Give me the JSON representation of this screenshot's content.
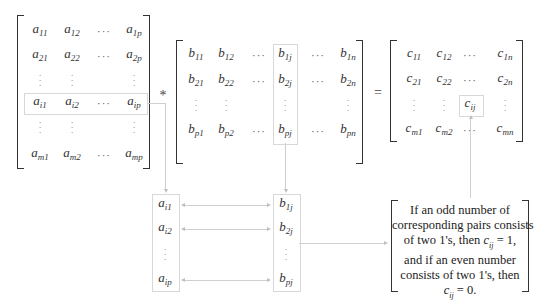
{
  "matrix_a": {
    "name": "A",
    "rows": [
      [
        "a_11",
        "a_12",
        "⋯",
        "a_1p"
      ],
      [
        "a_21",
        "a_22",
        "⋯",
        "a_2p"
      ],
      [
        "⋮",
        "⋮",
        "",
        "⋮"
      ],
      [
        "a_i1",
        "a_i2",
        "⋯",
        "a_ip"
      ],
      [
        "⋮",
        "⋮",
        "",
        "⋮"
      ],
      [
        "a_m1",
        "a_m2",
        "⋯",
        "a_mp"
      ]
    ],
    "highlighted_row": "i"
  },
  "operator_multiply": "*",
  "matrix_b": {
    "name": "B",
    "rows": [
      [
        "b_11",
        "b_12",
        "⋯",
        "b_1j",
        "⋯",
        "b_1n"
      ],
      [
        "b_21",
        "b_22",
        "⋯",
        "b_2j",
        "⋯",
        "b_2n"
      ],
      [
        "⋮",
        "⋮",
        "",
        "⋮",
        "",
        "⋮"
      ],
      [
        "b_p1",
        "b_p2",
        "⋯",
        "b_pj",
        "⋯",
        "b_pn"
      ]
    ],
    "highlighted_column": "j"
  },
  "operator_equals": "=",
  "matrix_c": {
    "name": "C",
    "rows": [
      [
        "c_11",
        "c_12",
        "⋯",
        "c_1n"
      ],
      [
        "c_21",
        "c_22",
        "⋯",
        "c_2n"
      ],
      [
        "⋮",
        "⋮",
        "c_ij",
        "⋮"
      ],
      [
        "c_m1",
        "c_m2",
        "⋯",
        "c_mn"
      ]
    ],
    "highlighted_cell": "c_ij"
  },
  "row_vector": [
    "a_i1",
    "a_i2",
    "⋮",
    "a_ip"
  ],
  "column_vector": [
    "b_1j",
    "b_2j",
    "⋮",
    "b_pj"
  ],
  "rule": {
    "line1": "If an odd number of",
    "line2": "corresponding pairs consists",
    "line3_pre": "of two 1's, then ",
    "line3_math": "c",
    "line3_sub": "ij",
    "line3_post": " = 1,",
    "line4": "and if an even number",
    "line5": "consists of two 1's, then",
    "line6_math": "c",
    "line6_sub": "ij",
    "line6_post": " = 0."
  }
}
